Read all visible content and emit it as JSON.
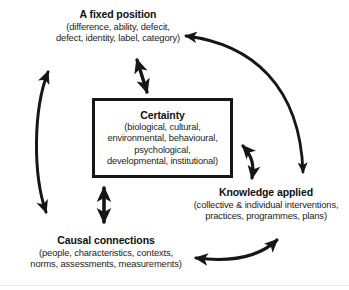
{
  "diagram": {
    "background_color": "#ffffff",
    "stroke_color": "#161616",
    "nodes": {
      "center": {
        "title": "Certainty",
        "sub_lines": [
          "(biological, cultural,",
          "environmental, behavioural,",
          "psychological,",
          "developmental, institutional)"
        ],
        "shape": "rectangle",
        "border_color": "#161616"
      },
      "top": {
        "title": "A fixed position",
        "sub_lines": [
          "(difference, ability, defecit,",
          "defect, identity, label, category)"
        ]
      },
      "right": {
        "title": "Knowledge applied",
        "sub_lines": [
          "(collective & individual interventions,",
          "practices, programmes, plans)"
        ]
      },
      "bottom_left": {
        "title": "Causal connections",
        "sub_lines": [
          "(people, characteristics, contexts,",
          "norms, assessments, measurements)"
        ]
      }
    },
    "connectors": [
      {
        "name": "fixed-position-to-certainty",
        "style": "double-headed-straight",
        "orientation": "diagonal",
        "from": "A fixed position",
        "to": "Certainty"
      },
      {
        "name": "certainty-to-causal-connections",
        "style": "double-headed-straight",
        "orientation": "vertical",
        "from": "Certainty",
        "to": "Causal connections"
      },
      {
        "name": "certainty-to-knowledge-applied",
        "style": "double-headed-curved",
        "orientation": "diagonal",
        "from": "Certainty",
        "to": "Knowledge applied"
      },
      {
        "name": "fixed-position-to-causal-connections",
        "style": "double-headed-curved",
        "orientation": "vertical-left",
        "from": "A fixed position",
        "to": "Causal connections"
      },
      {
        "name": "knowledge-applied-to-fixed-position",
        "style": "double-headed-curved-outer",
        "orientation": "right-arc",
        "from": "Knowledge applied",
        "to": "A fixed position"
      },
      {
        "name": "knowledge-applied-to-causal-connections",
        "style": "double-headed-curved",
        "orientation": "horizontal-bottom",
        "from": "Knowledge applied",
        "to": "Causal connections"
      }
    ]
  }
}
